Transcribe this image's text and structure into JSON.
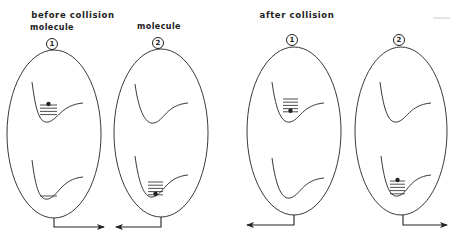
{
  "panels": {
    "before": {
      "title": "before collision",
      "title_x": 73,
      "title_y": 10
    },
    "after": {
      "title": "after collision",
      "title_x": 297,
      "title_y": 10
    }
  },
  "molecules": [
    {
      "panel": "before",
      "label": "molecule",
      "label_x": 52,
      "label_y": 33,
      "number": "1",
      "num_x": 52,
      "num_y": 38,
      "ellipse": {
        "cx": 54,
        "cy": 134,
        "rx": 47,
        "ry": 84
      },
      "arrow": {
        "stem_x": 54,
        "top_y": 218,
        "y": 227,
        "end_x": 104,
        "dir": "right"
      },
      "wells": [
        {
          "x0": 32,
          "y0": 82,
          "bottom_x": 48,
          "bottom_y": 122,
          "end_x": 83,
          "end_y": 103,
          "levels": 4,
          "level_x": 40,
          "level_w": 17,
          "level_top": 105,
          "dot_level": 0
        },
        {
          "x0": 32,
          "y0": 160,
          "bottom_x": 48,
          "bottom_y": 199,
          "end_x": 83,
          "end_y": 177,
          "levels": 1,
          "level_x": 40,
          "level_w": 17,
          "level_top": 196,
          "dot_level": -1
        }
      ]
    },
    {
      "panel": "before",
      "label": "molecule",
      "label_x": 159,
      "label_y": 32,
      "number": "2",
      "num_x": 158,
      "num_y": 37,
      "ellipse": {
        "cx": 161,
        "cy": 133,
        "rx": 47,
        "ry": 84
      },
      "arrow": {
        "stem_x": 161,
        "top_y": 217,
        "y": 227,
        "end_x": 116,
        "dir": "left"
      },
      "wells": [
        {
          "x0": 135,
          "y0": 84,
          "bottom_x": 154,
          "bottom_y": 123,
          "end_x": 188,
          "end_y": 103,
          "levels": 0,
          "level_x": 0,
          "level_w": 0,
          "level_top": 0,
          "dot_level": -1
        },
        {
          "x0": 135,
          "y0": 156,
          "bottom_x": 153,
          "bottom_y": 197,
          "end_x": 188,
          "end_y": 175,
          "levels": 5,
          "level_x": 148,
          "level_w": 15,
          "level_top": 182,
          "dot_level": 4
        }
      ]
    },
    {
      "panel": "after",
      "label": "",
      "label_x": 0,
      "label_y": 0,
      "number": "1",
      "num_x": 292,
      "num_y": 34,
      "ellipse": {
        "cx": 294,
        "cy": 131,
        "rx": 47,
        "ry": 84
      },
      "arrow": {
        "stem_x": 294,
        "top_y": 215,
        "y": 225,
        "end_x": 247,
        "dir": "left"
      },
      "wells": [
        {
          "x0": 272,
          "y0": 82,
          "bottom_x": 290,
          "bottom_y": 122,
          "end_x": 324,
          "end_y": 103,
          "levels": 5,
          "level_x": 283,
          "level_w": 15,
          "level_top": 99,
          "dot_level": 4
        },
        {
          "x0": 272,
          "y0": 158,
          "bottom_x": 290,
          "bottom_y": 198,
          "end_x": 324,
          "end_y": 178,
          "levels": 0,
          "level_x": 0,
          "level_w": 0,
          "level_top": 0,
          "dot_level": -1
        }
      ]
    },
    {
      "panel": "after",
      "label": "",
      "label_x": 0,
      "label_y": 0,
      "number": "2",
      "num_x": 399,
      "num_y": 34,
      "ellipse": {
        "cx": 401,
        "cy": 131,
        "rx": 46,
        "ry": 84
      },
      "arrow": {
        "stem_x": 403,
        "top_y": 215,
        "y": 225,
        "end_x": 447,
        "dir": "right"
      },
      "wells": [
        {
          "x0": 380,
          "y0": 82,
          "bottom_x": 397,
          "bottom_y": 122,
          "end_x": 431,
          "end_y": 103,
          "levels": 0,
          "level_x": 0,
          "level_w": 0,
          "level_top": 0,
          "dot_level": -1
        },
        {
          "x0": 381,
          "y0": 156,
          "bottom_x": 398,
          "bottom_y": 196,
          "end_x": 431,
          "end_y": 175,
          "levels": 5,
          "level_x": 390,
          "level_w": 15,
          "level_top": 181,
          "dot_level": 0
        }
      ]
    }
  ],
  "colors": {
    "stroke": "#222222",
    "artifact": "#c8c8c8"
  },
  "artifact": {
    "x1": 433,
    "y1": 18,
    "x2": 450,
    "y2": 18
  }
}
